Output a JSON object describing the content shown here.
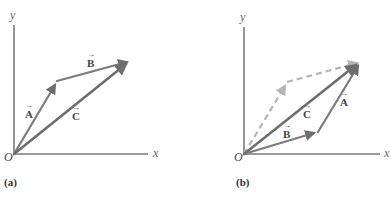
{
  "panels": [
    {
      "id": "a",
      "caption": "(a)",
      "axes": {
        "x_label": "x",
        "y_label": "y",
        "origin_label": "O"
      },
      "vectors": [
        {
          "name": "A",
          "label": "A",
          "from": "O",
          "to": "tip of A"
        },
        {
          "name": "B",
          "label": "B",
          "from": "tip of A",
          "to": "tip of C"
        },
        {
          "name": "C",
          "label": "C",
          "from": "O",
          "to": "tip of C"
        }
      ]
    },
    {
      "id": "b",
      "caption": "(b)",
      "axes": {
        "x_label": "x",
        "y_label": "y",
        "origin_label": "O"
      },
      "vectors": [
        {
          "name": "B",
          "label": "B",
          "from": "O",
          "to": "tip of B"
        },
        {
          "name": "A",
          "label": "A",
          "from": "tip of B",
          "to": "tip of C"
        },
        {
          "name": "C",
          "label": "C",
          "from": "O",
          "to": "tip of C"
        },
        {
          "name": "A-dashed",
          "label": "",
          "style": "dashed",
          "from": "O",
          "to": "tip of A"
        },
        {
          "name": "B-dashed",
          "label": "",
          "style": "dashed",
          "from": "tip of A",
          "to": "tip of C"
        }
      ]
    }
  ],
  "arrow_glyph": "→",
  "colors": {
    "vector": "#7c7c7c",
    "dashed": "#b5b5b5",
    "axis": "#7a7a7a"
  }
}
